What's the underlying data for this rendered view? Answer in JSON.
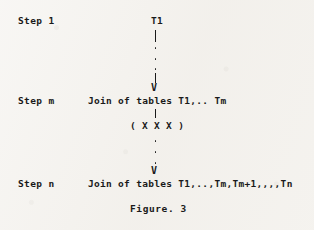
{
  "figure": {
    "caption": "Figure. 3",
    "background_color": "#f4f2ee",
    "ink_color": "#1a1a1a",
    "steps": [
      {
        "id": "step-1",
        "label": "Step 1",
        "node_text": "T1"
      },
      {
        "id": "step-m",
        "label": "Step m",
        "node_text": "Join of tables T1,.. Tm"
      },
      {
        "id": "step-n",
        "label": "Step n",
        "node_text": "Join of tables T1,..,Tm,Tm+1,,,,Tn"
      }
    ],
    "annotations": [
      {
        "id": "join-operator",
        "text": "( X X X )"
      }
    ],
    "connectors": [
      {
        "id": "connector-top",
        "from": "step-1",
        "to": "step-m",
        "ellipsis_dots": 3,
        "arrowhead": "V"
      },
      {
        "id": "connector-bottom",
        "from": "step-m",
        "to": "step-n",
        "ellipsis_dots": 3,
        "arrowhead": "V"
      }
    ]
  }
}
